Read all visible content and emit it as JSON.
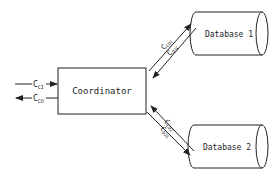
{
  "diagram": {
    "nodes": {
      "coordinator": {
        "label": "Coordinator"
      },
      "db1": {
        "label": "Database 1"
      },
      "db2": {
        "label": "Database 2"
      }
    },
    "edges": {
      "in": {
        "main": "C",
        "sub": "CI"
      },
      "out": {
        "main": "C",
        "sub": "CO"
      },
      "to_db1": {
        "main": "C",
        "sub": "CD1"
      },
      "from_db1": {
        "main": "C",
        "sub": "D1C"
      },
      "to_db2": {
        "main": "C",
        "sub": "CD2"
      },
      "from_db2": {
        "main": "C",
        "sub": "D2C"
      }
    },
    "colors": {
      "stroke": "#222222",
      "background": "#ffffff"
    }
  }
}
